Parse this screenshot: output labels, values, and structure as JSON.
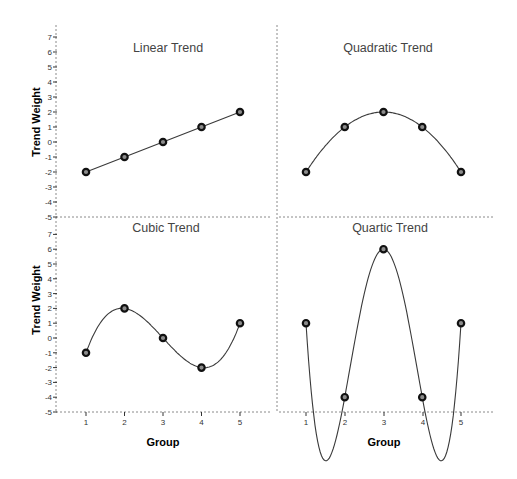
{
  "chart_data": [
    {
      "type": "line",
      "title": "Linear Trend",
      "xlabel": "Group",
      "ylabel": "Trend Weight",
      "x": [
        1,
        2,
        3,
        4,
        5
      ],
      "values": [
        -2,
        -1,
        0,
        1,
        2
      ],
      "ylim": [
        -5,
        7
      ],
      "yticks": [
        7,
        6,
        5,
        4,
        3,
        2,
        1,
        0,
        -1,
        -2,
        -3,
        -4,
        -5
      ],
      "smooth": false,
      "grid": false
    },
    {
      "type": "line",
      "title": "Quadratic Trend",
      "xlabel": "Group",
      "ylabel": "",
      "x": [
        1,
        2,
        3,
        4,
        5
      ],
      "values": [
        -2,
        1,
        2,
        1,
        -2
      ],
      "ylim": [
        -5,
        7
      ],
      "smooth": true,
      "grid": false
    },
    {
      "type": "line",
      "title": "Cubic Trend",
      "xlabel": "Group",
      "ylabel": "Trend Weight",
      "x": [
        1,
        2,
        3,
        4,
        5
      ],
      "values": [
        -1,
        2,
        0,
        -2,
        1
      ],
      "ylim": [
        -5,
        7
      ],
      "yticks": [
        7,
        6,
        5,
        4,
        3,
        2,
        1,
        0,
        -1,
        -2,
        -3,
        -4,
        -5
      ],
      "smooth": true,
      "grid": false
    },
    {
      "type": "line",
      "title": "Quartic Trend",
      "xlabel": "Group",
      "ylabel": "",
      "x": [
        1,
        2,
        3,
        4,
        5
      ],
      "values": [
        1,
        -4,
        6,
        -4,
        1
      ],
      "ylim": [
        -5,
        7
      ],
      "smooth": true,
      "grid": false
    }
  ],
  "labels": {
    "y_axis_title": "Trend Weight",
    "x_axis_title": "Group",
    "x_tick_labels": [
      "1",
      "2",
      "3",
      "4",
      "5"
    ],
    "y_tick_labels": [
      "7",
      "6",
      "5",
      "4",
      "3",
      "2",
      "1",
      "0",
      "-1",
      "-2",
      "-3",
      "-4",
      "-5"
    ]
  },
  "colors": {
    "curve": "#3a3a3a",
    "marker_fill": "#8c8c8c",
    "marker_stroke": "#111111",
    "divider": "#8a8a8a",
    "title_text": "#444444"
  }
}
